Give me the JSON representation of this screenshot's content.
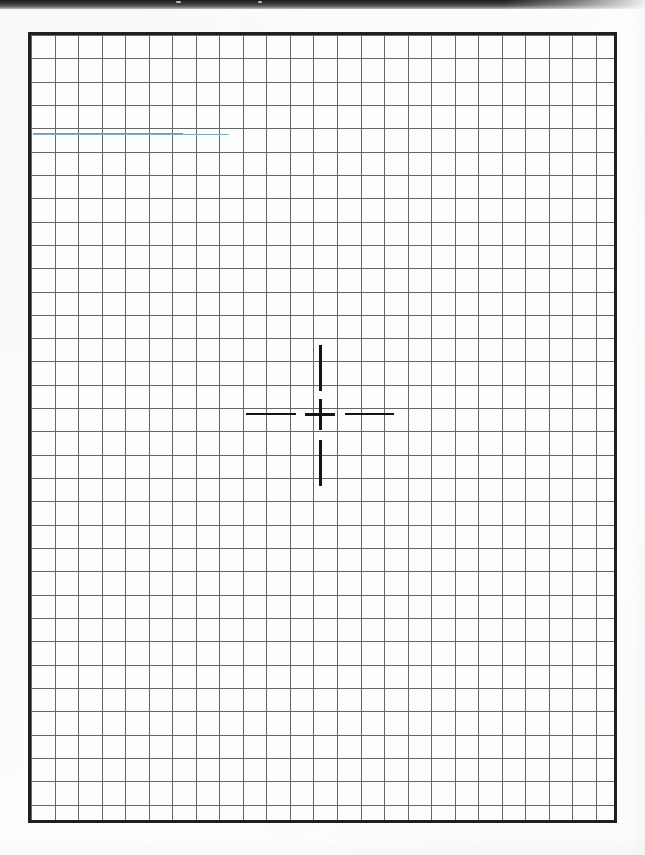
{
  "document": {
    "kind": "scanned-graph-paper",
    "page_width": 645,
    "page_height": 855,
    "background_color": "#ffffff",
    "paper_color": "#fdfdfc"
  },
  "scan_band": {
    "name": "scanner-dark-edge",
    "top": 0,
    "height": 9,
    "color_dark": "#1a1a1a",
    "color_light": "#b8b8b8"
  },
  "grid": {
    "label": "graph-paper-grid",
    "left": 28,
    "top": 32,
    "width": 589,
    "height": 791,
    "columns": 25,
    "rows": 34,
    "cell_width": 23.54,
    "cell_height": 23.32,
    "line_color": "#64666a",
    "border_color": "#1f1f1f",
    "border_width": 3,
    "fill_color": "#fdfdfd"
  },
  "artifacts": {
    "red_bleed_color": "#d6786e",
    "cyan_bleed_color": "#78afb9"
  },
  "crosshair": {
    "label": "crosshair-marker",
    "center_x": 320,
    "center_y": 414,
    "color": "#141414",
    "center_cross_width": 30,
    "center_cross_height": 31,
    "arm_thickness": 3,
    "left_arm": {
      "start_x": 246,
      "end_x": 296
    },
    "right_arm": {
      "start_x": 345,
      "end_x": 394
    },
    "top_arm": {
      "start_y": 345,
      "end_y": 391
    },
    "bottom_arm": {
      "start_y": 440,
      "end_y": 486
    }
  }
}
